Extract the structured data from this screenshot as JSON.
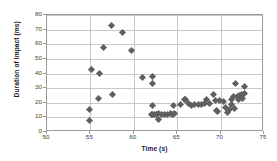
{
  "chart_data": {
    "type": "scatter",
    "title": "",
    "xlabel": "Time (s)",
    "ylabel": "Duration of Impact (ms)",
    "xlim": [
      50,
      75
    ],
    "ylim": [
      0,
      80
    ],
    "xticks": [
      50,
      55,
      60,
      65,
      70,
      75
    ],
    "yticks": [
      0,
      10,
      20,
      30,
      40,
      50,
      60,
      70,
      80
    ],
    "grid": "horizontal-and-vertical",
    "legend": "none",
    "marker": "diamond",
    "marker_color": "#5f5f5f",
    "series": [
      {
        "name": "Duration of Impact",
        "points": [
          [
            54.9,
            8.0
          ],
          [
            54.9,
            15.3
          ],
          [
            55.1,
            42.8
          ],
          [
            55.9,
            22.8
          ],
          [
            56.0,
            40.3
          ],
          [
            56.5,
            57.5
          ],
          [
            57.4,
            72.8
          ],
          [
            57.5,
            25.3
          ],
          [
            58.7,
            68.0
          ],
          [
            59.7,
            55.5
          ],
          [
            61.0,
            37.5
          ],
          [
            62.2,
            38.0
          ],
          [
            62.2,
            33.0
          ],
          [
            62.1,
            18.0
          ],
          [
            62.0,
            12.0
          ],
          [
            62.2,
            12.2
          ],
          [
            62.4,
            12.0
          ],
          [
            62.6,
            11.8
          ],
          [
            62.8,
            12.8
          ],
          [
            62.8,
            8.3
          ],
          [
            63.2,
            12.0
          ],
          [
            63.5,
            12.0
          ],
          [
            63.9,
            12.2
          ],
          [
            64.2,
            12.5
          ],
          [
            64.5,
            12.2
          ],
          [
            64.6,
            17.8
          ],
          [
            64.7,
            12.5
          ],
          [
            65.4,
            19.0
          ],
          [
            65.8,
            22.5
          ],
          [
            65.9,
            22.0
          ],
          [
            66.3,
            19.5
          ],
          [
            66.7,
            18.0
          ],
          [
            67.0,
            18.5
          ],
          [
            67.4,
            18.5
          ],
          [
            67.8,
            19.0
          ],
          [
            68.1,
            19.5
          ],
          [
            68.4,
            22.5
          ],
          [
            68.7,
            19.5
          ],
          [
            69.2,
            25.5
          ],
          [
            69.4,
            21.5
          ],
          [
            69.5,
            15.0
          ],
          [
            69.6,
            14.0
          ],
          [
            69.9,
            21.5
          ],
          [
            70.3,
            21.0
          ],
          [
            70.6,
            16.5
          ],
          [
            70.8,
            13.5
          ],
          [
            71.0,
            15.5
          ],
          [
            71.2,
            19.0
          ],
          [
            71.3,
            22.0
          ],
          [
            71.5,
            24.0
          ],
          [
            71.6,
            16.0
          ],
          [
            71.7,
            33.3
          ],
          [
            72.0,
            24.5
          ],
          [
            72.1,
            22.0
          ],
          [
            72.2,
            25.0
          ],
          [
            72.4,
            25.5
          ],
          [
            72.5,
            23.0
          ],
          [
            72.7,
            30.8
          ],
          [
            72.8,
            26.0
          ]
        ]
      }
    ]
  }
}
